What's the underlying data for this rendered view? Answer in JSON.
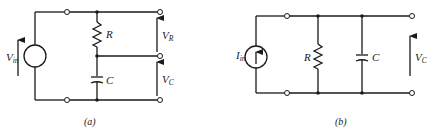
{
  "figure": {
    "panels": [
      {
        "id": "a",
        "caption": "(a)",
        "description": "Series RC circuit driven by a voltage source",
        "source": {
          "type": "voltage-source",
          "label_main": "V",
          "label_sub": "in"
        },
        "components": [
          {
            "type": "resistor",
            "label": "R"
          },
          {
            "type": "capacitor",
            "label": "C"
          }
        ],
        "outputs": [
          {
            "label_main": "V",
            "label_sub": "R",
            "across": "R"
          },
          {
            "label_main": "V",
            "label_sub": "C",
            "across": "C"
          }
        ]
      },
      {
        "id": "b",
        "caption": "(b)",
        "description": "Parallel RC circuit driven by a current source",
        "source": {
          "type": "current-source",
          "label_main": "I",
          "label_sub": "in"
        },
        "components": [
          {
            "type": "resistor",
            "label": "R"
          },
          {
            "type": "capacitor",
            "label": "C"
          }
        ],
        "outputs": [
          {
            "label_main": "V",
            "label_sub": "C",
            "across": "C"
          }
        ]
      }
    ]
  }
}
